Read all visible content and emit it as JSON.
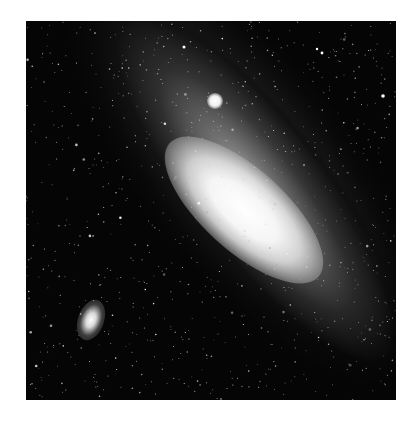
{
  "image": {
    "subject": "Spiral galaxy photographed against a dense star field",
    "description": "Black-and-white astronomical photograph of the Andromeda Galaxy (M31) shown diagonally with a bright core, a small bright satellite galaxy above the core, and a second elliptical satellite galaxy at lower left",
    "colors": {
      "background_page": "#ffffff",
      "sky": "#050505",
      "core": "#ffffff",
      "disk": "#9a9a9a"
    }
  }
}
